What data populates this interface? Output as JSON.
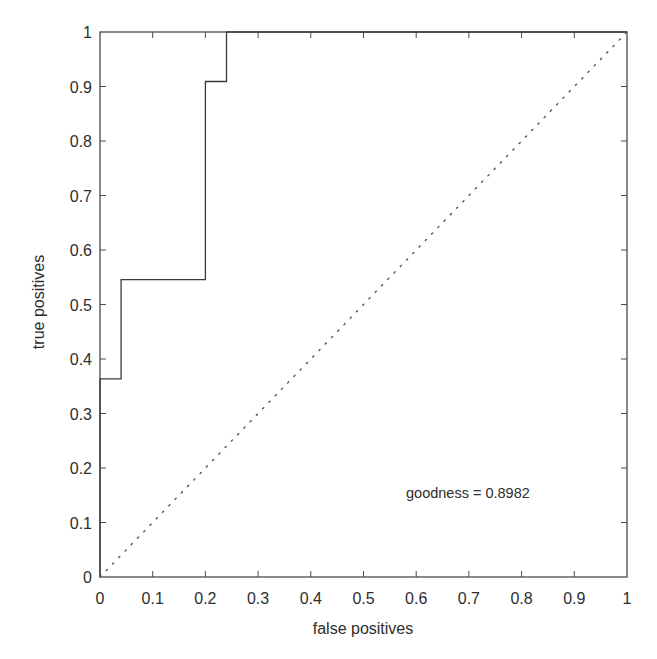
{
  "chart_data": {
    "type": "line",
    "title": "",
    "xlabel": "false positives",
    "ylabel": "true positives",
    "xlim": [
      0,
      1
    ],
    "ylim": [
      0,
      1
    ],
    "grid": false,
    "legend": null,
    "x_ticks": [
      "0",
      "0.1",
      "0.2",
      "0.3",
      "0.4",
      "0.5",
      "0.6",
      "0.7",
      "0.8",
      "0.9",
      "1"
    ],
    "y_ticks": [
      "0",
      "0.1",
      "0.2",
      "0.3",
      "0.4",
      "0.5",
      "0.6",
      "0.7",
      "0.8",
      "0.9",
      "1"
    ],
    "series": [
      {
        "name": "ROC curve",
        "style": "solid-step",
        "x": [
          0,
          0,
          0.04,
          0.04,
          0.2,
          0.2,
          0.24,
          0.24,
          1
        ],
        "y": [
          0,
          0.3636,
          0.3636,
          0.5455,
          0.5455,
          0.9091,
          0.9091,
          1,
          1
        ]
      },
      {
        "name": "chance diagonal",
        "style": "dotted",
        "x": [
          0,
          1
        ],
        "y": [
          0,
          1
        ]
      }
    ],
    "annotations": [
      {
        "text": "goodness = 0.8982",
        "x": 0.58,
        "y": 0.155
      }
    ]
  },
  "colors": {
    "axes": "#4a4a4a",
    "curve": "#3a3a3a",
    "diagonal": "#555555",
    "text": "#2e2e2e",
    "background": "#ffffff"
  }
}
